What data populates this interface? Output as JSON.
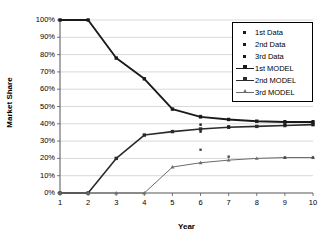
{
  "chart_data": {
    "type": "line",
    "title": "",
    "xlabel": "Year",
    "ylabel": "Market Share",
    "categories": [
      1,
      2,
      3,
      4,
      5,
      6,
      7,
      8,
      9,
      10
    ],
    "x": [
      1,
      2,
      3,
      4,
      5,
      6,
      7,
      8,
      9,
      10
    ],
    "xlim": [
      1,
      10
    ],
    "ylim": [
      0,
      100
    ],
    "ytick_labels": [
      "100%",
      "90%",
      "80%",
      "70%",
      "60%",
      "50%",
      "40%",
      "30%",
      "20%",
      "10%",
      "0%"
    ],
    "ytick_values": [
      100,
      90,
      80,
      70,
      60,
      50,
      40,
      30,
      20,
      10,
      0
    ],
    "xtick_labels": [
      "1",
      "2",
      "3",
      "4",
      "5",
      "6",
      "7",
      "8",
      "9",
      "10"
    ],
    "grid": true,
    "grid_axis": "y",
    "legend_position": "top-right",
    "y_unit": "percent",
    "series": [
      {
        "name": "1st MODEL",
        "kind": "line",
        "marker": "square",
        "color": "#1a1a1a",
        "values": [
          100,
          100,
          78,
          66,
          48.5,
          44,
          42.5,
          41.5,
          41,
          41
        ]
      },
      {
        "name": "2nd MODEL",
        "kind": "line",
        "marker": "square",
        "color": "#2b2b2b",
        "values": [
          0,
          0,
          20,
          33.5,
          35.5,
          37,
          38,
          38.5,
          39,
          39.5
        ]
      },
      {
        "name": "3rd MODEL",
        "kind": "line",
        "marker": "triangle",
        "color": "#6b6b6b",
        "values": [
          0,
          0,
          0,
          0,
          15,
          17.5,
          19,
          20,
          20.5,
          20.5
        ]
      },
      {
        "name": "1st Data",
        "kind": "scatter",
        "marker": "dot",
        "color": "#1a1a1a",
        "points": [
          {
            "x": 6,
            "y": 44.5
          },
          {
            "x": 7,
            "y": 42.5
          },
          {
            "x": 9,
            "y": 41.5
          },
          {
            "x": 10,
            "y": 41.5
          }
        ]
      },
      {
        "name": "2nd Data",
        "kind": "scatter",
        "marker": "dot",
        "color": "#1a1a1a",
        "points": [
          {
            "x": 6,
            "y": 39.5
          },
          {
            "x": 6,
            "y": 35.5
          },
          {
            "x": 7,
            "y": 38.5
          },
          {
            "x": 9,
            "y": 39.5
          },
          {
            "x": 10,
            "y": 39.5
          }
        ]
      },
      {
        "name": "3rd Data",
        "kind": "scatter",
        "marker": "dot",
        "color": "#4a4a4a",
        "points": [
          {
            "x": 6,
            "y": 25
          },
          {
            "x": 7,
            "y": 21
          },
          {
            "x": 9,
            "y": 20.5
          },
          {
            "x": 10,
            "y": 20.5
          }
        ]
      }
    ]
  },
  "legend": {
    "items": [
      {
        "label": "1st Data",
        "marker": "dot",
        "name": "legend-item-1st-data"
      },
      {
        "label": "2nd Data",
        "marker": "dot",
        "name": "legend-item-2nd-data"
      },
      {
        "label": "3rd Data",
        "marker": "dot",
        "name": "legend-item-3rd-data"
      },
      {
        "label": "1st MODEL",
        "marker": "line-square",
        "name": "legend-item-1st-model"
      },
      {
        "label": "2nd MODEL",
        "marker": "line-square",
        "name": "legend-item-2nd-model"
      },
      {
        "label": "3rd MODEL",
        "marker": "line-triangle",
        "name": "legend-item-3rd-model"
      }
    ]
  },
  "colors": {
    "series_1": "#1a1a1a",
    "series_2": "#2b2b2b",
    "series_3": "#6b6b6b",
    "grid": "#c8c8c8",
    "axis": "#555555",
    "background": "#ffffff"
  }
}
